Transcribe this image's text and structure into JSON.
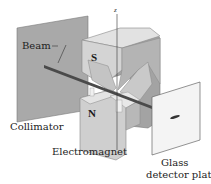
{
  "diagram": {
    "labels": {
      "beam": "Beam",
      "collimator": "Collimator",
      "electromagnet": "Electromagnet",
      "detector_line1": "Glass",
      "detector_line2": "detector plate",
      "south_pole": "S",
      "north_pole": "N",
      "axis": "z"
    },
    "colors": {
      "collimator": "#a8a8a8",
      "magnet_light": "#d6d6d6",
      "magnet_mid": "#bdbdbd",
      "magnet_dark": "#9a9a9a",
      "beam": "#4a4a4a",
      "detector": "#f4f4f4",
      "text": "#222222"
    }
  }
}
